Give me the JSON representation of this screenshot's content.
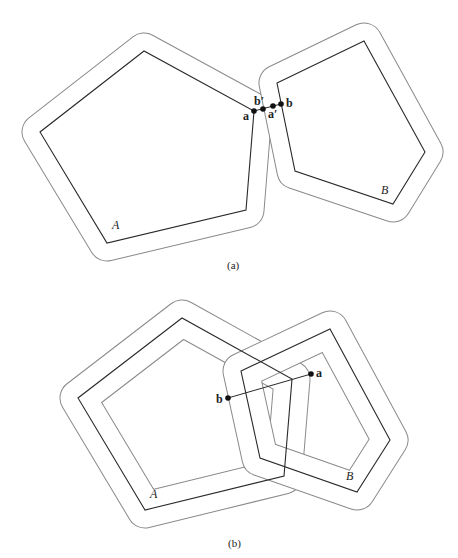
{
  "panels": [
    {
      "caption": "(a)",
      "labels": {
        "A": "A",
        "B": "B",
        "a": "a",
        "b": "b",
        "a_prime": "a′",
        "b_prime": "b′"
      }
    },
    {
      "caption": "(b)",
      "labels": {
        "A": "A",
        "B": "B",
        "a": "a",
        "b": "b"
      }
    }
  ],
  "colors": {
    "polygon": "#2a2a2a",
    "offset": "#8a8a8a",
    "point": "#111111"
  }
}
